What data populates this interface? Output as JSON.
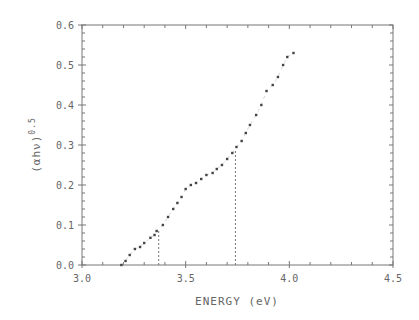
{
  "chart_data": {
    "type": "scatter",
    "title": "",
    "xlabel": "ENERGY  (eV)",
    "ylabel": "(αhν)",
    "ylabel_exponent": "0.5",
    "xlim": [
      3.0,
      4.5
    ],
    "ylim": [
      0.0,
      0.6
    ],
    "x_ticks": [
      3.0,
      3.5,
      4.0,
      4.5
    ],
    "x_tick_labels": [
      "3.0",
      "3.5",
      "4.0",
      "4.5"
    ],
    "x_minor_step": 0.1,
    "y_ticks": [
      0.0,
      0.1,
      0.2,
      0.3,
      0.4,
      0.5,
      0.6
    ],
    "y_tick_labels": [
      "0.0",
      "0.1",
      "0.2",
      "0.3",
      "0.4",
      "0.5",
      "0.6"
    ],
    "y_minor_step": 0.02,
    "grid": false,
    "legend": null,
    "series": [
      {
        "name": "data",
        "x": [
          3.19,
          3.21,
          3.23,
          3.255,
          3.28,
          3.3,
          3.33,
          3.35,
          3.36,
          3.39,
          3.415,
          3.44,
          3.46,
          3.48,
          3.5,
          3.525,
          3.55,
          3.575,
          3.6,
          3.63,
          3.65,
          3.675,
          3.7,
          3.725,
          3.745,
          3.77,
          3.79,
          3.81,
          3.84,
          3.865,
          3.89,
          3.92,
          3.945,
          3.97,
          3.99,
          4.02
        ],
        "y": [
          0.0,
          0.01,
          0.025,
          0.04,
          0.045,
          0.055,
          0.068,
          0.075,
          0.085,
          0.1,
          0.12,
          0.14,
          0.155,
          0.17,
          0.19,
          0.2,
          0.205,
          0.215,
          0.225,
          0.23,
          0.24,
          0.25,
          0.265,
          0.28,
          0.295,
          0.31,
          0.33,
          0.35,
          0.375,
          0.4,
          0.435,
          0.45,
          0.47,
          0.5,
          0.52,
          0.53
        ]
      }
    ],
    "annotations": [
      {
        "type": "vline-dashed",
        "x": 3.37,
        "y_top": 0.085
      },
      {
        "type": "vline-dashed",
        "x": 3.74,
        "y_top": 0.29
      }
    ]
  }
}
